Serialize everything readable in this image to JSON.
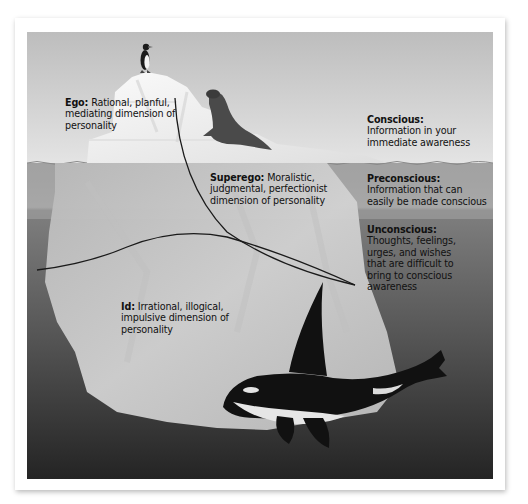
{
  "diagram": {
    "structures": [
      {
        "key": "ego",
        "term": "Ego:",
        "description": "Rational, planful, mediating dimension of personality",
        "lines": [
          "Rational, planful,",
          "mediating dimension of",
          "personality"
        ]
      },
      {
        "key": "superego",
        "term": "Superego:",
        "description": "Moralistic, judgmental, perfectionist dimension of personality",
        "lines": [
          "Moralistic,",
          "judgmental, perfectionist",
          "dimension of personality"
        ]
      },
      {
        "key": "id",
        "term": "Id:",
        "description": "Irrational, illogical, impulsive dimension of personality",
        "lines": [
          "Irrational, illogical,",
          "impulsive dimension",
          "of personality"
        ]
      }
    ],
    "levels": [
      {
        "key": "conscious",
        "term": "Conscious:",
        "description": "Information in your immediate awareness",
        "lines": [
          "Information in your",
          "immediate awareness"
        ]
      },
      {
        "key": "preconscious",
        "term": "Preconscious:",
        "description": "Information that can easily be made conscious",
        "lines": [
          "Information that can",
          "easily be made conscious"
        ]
      },
      {
        "key": "unconscious",
        "term": "Unconscious:",
        "description": "Thoughts, feelings, urges, and wishes that are difficult to bring to conscious awareness",
        "lines": [
          "Thoughts, feelings,",
          "urges, and wishes",
          "that are difficult to",
          "bring to conscious",
          "awareness"
        ]
      }
    ],
    "illustration": {
      "animals": [
        "penguin",
        "seal",
        "orca"
      ],
      "colors": {
        "sky": "#c9c9c9",
        "ice_above": "#f2f2f2",
        "water_preconscious": "#a8a8a8",
        "water_unconscious": "#6e6e6e",
        "deep_water": "#2e2e2e",
        "ice_below": "#d6d6d6",
        "divider_line": "#1a1a1a"
      }
    }
  }
}
